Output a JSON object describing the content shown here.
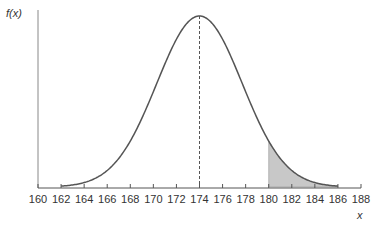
{
  "chart_data": {
    "type": "line",
    "title": "",
    "xlabel": "x",
    "ylabel": "f(x)",
    "distribution": "normal",
    "mean": 174,
    "sd": 3.7,
    "xlim": [
      160,
      188
    ],
    "x_ticks": [
      160,
      162,
      164,
      166,
      168,
      170,
      172,
      174,
      176,
      178,
      180,
      182,
      184,
      186,
      188
    ],
    "mean_line": {
      "x": 174,
      "style": "dashed"
    },
    "shaded_region": {
      "from": 180,
      "to": 188,
      "color": "#c8c8c8"
    },
    "curve_color": "#555555",
    "grid": false,
    "legend": null
  },
  "labels": {
    "ylabel": "f(x)",
    "xlabel": "x"
  }
}
